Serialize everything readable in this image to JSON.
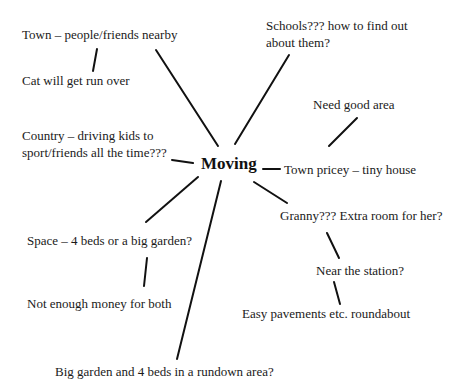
{
  "diagram": {
    "type": "mind-map",
    "center": {
      "label": "Moving"
    },
    "nodes": [
      {
        "id": "town",
        "label": "Town – people/friends nearby"
      },
      {
        "id": "cat",
        "label": "Cat will get run over"
      },
      {
        "id": "schools_1",
        "label": "Schools??? how to find out"
      },
      {
        "id": "schools_2",
        "label": "about them?"
      },
      {
        "id": "need_area",
        "label": "Need good area"
      },
      {
        "id": "country_1",
        "label": "Country – driving kids to"
      },
      {
        "id": "country_2",
        "label": "sport/friends all the time???"
      },
      {
        "id": "town_pricey",
        "label": "Town pricey – tiny house"
      },
      {
        "id": "granny",
        "label": "Granny??? Extra room for her?"
      },
      {
        "id": "space",
        "label": "Space – 4 beds or a big garden?"
      },
      {
        "id": "near_station",
        "label": "Near the station?"
      },
      {
        "id": "not_enough",
        "label": "Not enough money for both"
      },
      {
        "id": "easy",
        "label": "Easy pavements etc. roundabout"
      },
      {
        "id": "big_garden",
        "label": "Big garden and 4 beds in a rundown area?"
      }
    ],
    "edges": [
      [
        "Moving",
        "Town – people/friends nearby"
      ],
      [
        "Town – people/friends nearby",
        "Cat will get run over"
      ],
      [
        "Moving",
        "Schools??? how to find out about them?"
      ],
      [
        "Town pricey – tiny house",
        "Need good area"
      ],
      [
        "Moving",
        "Country – driving kids to sport/friends all the time???"
      ],
      [
        "Moving",
        "Town pricey – tiny house"
      ],
      [
        "Moving",
        "Space – 4 beds or a big garden?"
      ],
      [
        "Space – 4 beds or a big garden?",
        "Not enough money for both"
      ],
      [
        "Moving",
        "Big garden and 4 beds in a rundown area?"
      ],
      [
        "Moving",
        "Granny??? Extra room for her?"
      ],
      [
        "Granny??? Extra room for her?",
        "Near the station?"
      ],
      [
        "Near the station?",
        "Easy pavements etc. roundabout"
      ]
    ]
  }
}
